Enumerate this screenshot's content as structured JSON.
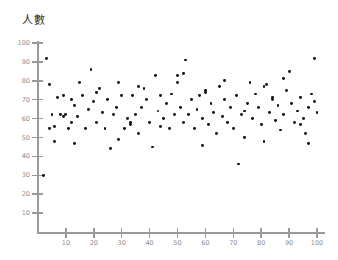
{
  "chart_data": {
    "type": "scatter",
    "title": "人數",
    "xlabel": "",
    "ylabel": "",
    "xlim": [
      0,
      104
    ],
    "ylim": [
      0,
      104
    ],
    "xticks": [
      10,
      20,
      30,
      40,
      50,
      60,
      70,
      80,
      90,
      100
    ],
    "yticks": [
      10,
      20,
      30,
      40,
      50,
      60,
      70,
      80,
      90,
      100
    ],
    "grid": false,
    "legend": null,
    "marker_color": "#121212",
    "axis_color": "#9a9a9a",
    "tick_label_color": "#8d8d8d",
    "title_color": "#2b2b2b",
    "point_count": 120,
    "points": [
      [
        2,
        30
      ],
      [
        3,
        92
      ],
      [
        4,
        78
      ],
      [
        4,
        55
      ],
      [
        5,
        62
      ],
      [
        6,
        56
      ],
      [
        7,
        71
      ],
      [
        8,
        62
      ],
      [
        9,
        61
      ],
      [
        9,
        72
      ],
      [
        10,
        62
      ],
      [
        11,
        55
      ],
      [
        12,
        58
      ],
      [
        12,
        70
      ],
      [
        13,
        47
      ],
      [
        14,
        61
      ],
      [
        15,
        79
      ],
      [
        16,
        72
      ],
      [
        17,
        55
      ],
      [
        18,
        65
      ],
      [
        19,
        86
      ],
      [
        20,
        69
      ],
      [
        21,
        58
      ],
      [
        22,
        76
      ],
      [
        23,
        63
      ],
      [
        24,
        55
      ],
      [
        25,
        70
      ],
      [
        26,
        44
      ],
      [
        27,
        62
      ],
      [
        28,
        66
      ],
      [
        29,
        79
      ],
      [
        30,
        72
      ],
      [
        31,
        55
      ],
      [
        32,
        60
      ],
      [
        33,
        57
      ],
      [
        33,
        58
      ],
      [
        34,
        72
      ],
      [
        35,
        62
      ],
      [
        36,
        52
      ],
      [
        37,
        66
      ],
      [
        38,
        76
      ],
      [
        39,
        70
      ],
      [
        40,
        58
      ],
      [
        41,
        45
      ],
      [
        42,
        83
      ],
      [
        43,
        64
      ],
      [
        44,
        72
      ],
      [
        45,
        60
      ],
      [
        46,
        68
      ],
      [
        47,
        55
      ],
      [
        48,
        73
      ],
      [
        49,
        62
      ],
      [
        50,
        79
      ],
      [
        50,
        83
      ],
      [
        51,
        66
      ],
      [
        52,
        58
      ],
      [
        53,
        91
      ],
      [
        54,
        62
      ],
      [
        55,
        70
      ],
      [
        56,
        55
      ],
      [
        57,
        65
      ],
      [
        58,
        72
      ],
      [
        59,
        60
      ],
      [
        60,
        74
      ],
      [
        60,
        75
      ],
      [
        61,
        57
      ],
      [
        62,
        68
      ],
      [
        63,
        63
      ],
      [
        64,
        52
      ],
      [
        65,
        77
      ],
      [
        66,
        61
      ],
      [
        67,
        70
      ],
      [
        68,
        58
      ],
      [
        69,
        66
      ],
      [
        70,
        55
      ],
      [
        71,
        72
      ],
      [
        72,
        36
      ],
      [
        73,
        62
      ],
      [
        74,
        50
      ],
      [
        75,
        68
      ],
      [
        76,
        79
      ],
      [
        77,
        60
      ],
      [
        78,
        73
      ],
      [
        79,
        66
      ],
      [
        80,
        57
      ],
      [
        81,
        77
      ],
      [
        82,
        78
      ],
      [
        83,
        63
      ],
      [
        84,
        70
      ],
      [
        84,
        71
      ],
      [
        85,
        59
      ],
      [
        86,
        67
      ],
      [
        87,
        54
      ],
      [
        88,
        62
      ],
      [
        89,
        75
      ],
      [
        90,
        85
      ],
      [
        91,
        68
      ],
      [
        92,
        58
      ],
      [
        93,
        64
      ],
      [
        94,
        71
      ],
      [
        95,
        60
      ],
      [
        96,
        52
      ],
      [
        97,
        66
      ],
      [
        98,
        73
      ],
      [
        99,
        92
      ],
      [
        100,
        63
      ],
      [
        6,
        48
      ],
      [
        13,
        67
      ],
      [
        21,
        74
      ],
      [
        29,
        49
      ],
      [
        36,
        77
      ],
      [
        44,
        56
      ],
      [
        52,
        84
      ],
      [
        59,
        46
      ],
      [
        67,
        80
      ],
      [
        74,
        64
      ],
      [
        81,
        48
      ],
      [
        88,
        81
      ],
      [
        94,
        57
      ],
      [
        97,
        47
      ],
      [
        99,
        69
      ]
    ]
  }
}
